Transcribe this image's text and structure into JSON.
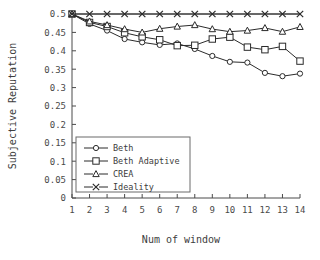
{
  "chart_data": {
    "type": "line",
    "title": "",
    "xlabel": "Num of window",
    "ylabel": "Subjective Reputation",
    "x": [
      1,
      2,
      3,
      4,
      5,
      6,
      7,
      8,
      9,
      10,
      11,
      12,
      13,
      14
    ],
    "xtick_labels": [
      "1",
      "2",
      "3",
      "4",
      "5",
      "6",
      "7",
      "8",
      "9",
      "10",
      "11",
      "12",
      "13",
      "14"
    ],
    "ytick_labels": [
      "0",
      "0.05",
      "0.1",
      "0.15",
      "0.2",
      "0.25",
      "0.3",
      "0.35",
      "0.4",
      "0.45",
      "0.5"
    ],
    "ytick_values": [
      0,
      0.05,
      0.1,
      0.15,
      0.2,
      0.25,
      0.3,
      0.35,
      0.4,
      0.45,
      0.5
    ],
    "ylim": [
      0,
      0.5
    ],
    "xlim": [
      1,
      14
    ],
    "grid": false,
    "legend_position": "lower-left-inside",
    "series": [
      {
        "name": "Beth",
        "marker": "circle-small",
        "values": [
          0.5,
          0.473,
          0.455,
          0.432,
          0.423,
          0.416,
          0.42,
          0.405,
          0.386,
          0.37,
          0.368,
          0.34,
          0.331,
          0.338
        ]
      },
      {
        "name": "Beth Adaptive",
        "marker": "square",
        "values": [
          0.5,
          0.477,
          0.466,
          0.449,
          0.438,
          0.43,
          0.414,
          0.415,
          0.432,
          0.437,
          0.41,
          0.403,
          0.412,
          0.372
        ]
      },
      {
        "name": "CREA",
        "marker": "triangle",
        "values": [
          0.5,
          0.48,
          0.47,
          0.459,
          0.45,
          0.46,
          0.466,
          0.47,
          0.459,
          0.452,
          0.455,
          0.462,
          0.452,
          0.465
        ]
      },
      {
        "name": "Ideality",
        "marker": "x",
        "values": [
          0.5,
          0.5,
          0.5,
          0.5,
          0.5,
          0.5,
          0.5,
          0.5,
          0.5,
          0.5,
          0.5,
          0.5,
          0.5,
          0.5
        ]
      }
    ],
    "colors": {
      "axis": "#4a4a4a",
      "line": "#2b2b2b",
      "marker_fill": "#ffffff",
      "background": "#ffffff"
    }
  }
}
